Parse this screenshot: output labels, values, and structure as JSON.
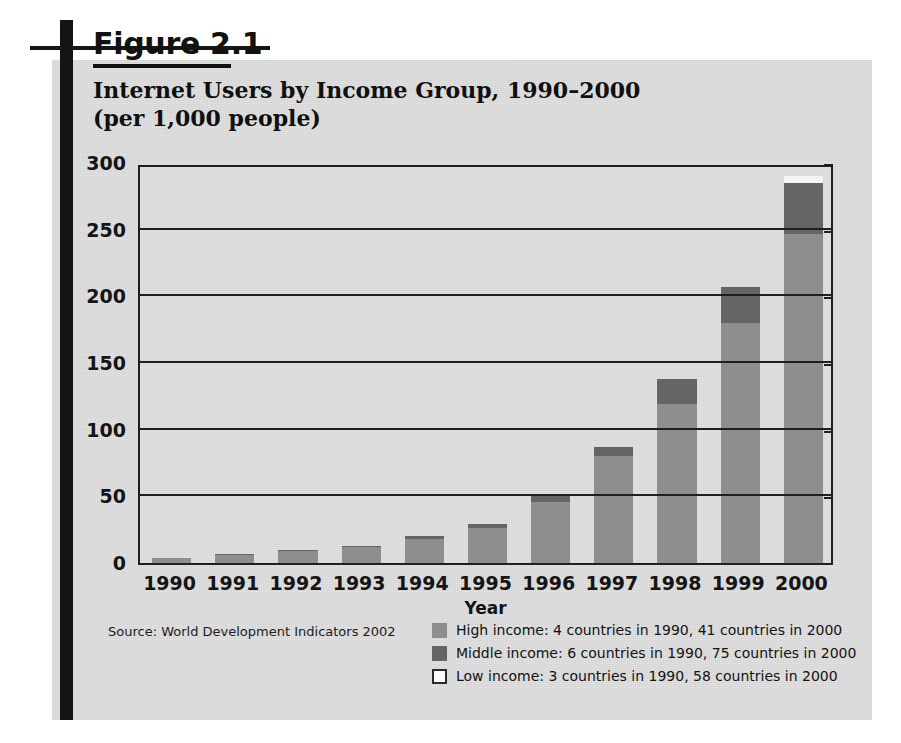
{
  "figure": {
    "number_label": "Figure 2.1",
    "title_line1": "Internet Users by Income Group, 1990–2000",
    "title_line2": "(per 1,000 people)",
    "source": "Source: World Development Indicators 2002"
  },
  "colors": {
    "high_income": "#8e8e8e",
    "middle_income": "#656565",
    "low_income": "#f4f4f4",
    "panel_background": "#d9d9d9",
    "axis": "#1f1f1f",
    "rule": "#141414"
  },
  "legend": {
    "position": "bottom-right",
    "items": [
      {
        "key": "high",
        "swatch": "high",
        "label": "High income: 4 countries in 1990, 41 countries in 2000"
      },
      {
        "key": "middle",
        "swatch": "middle",
        "label": "Middle income: 6 countries in 1990, 75 countries in 2000"
      },
      {
        "key": "low",
        "swatch": "low",
        "label": "Low income: 3 countries in 1990, 58 countries in 2000"
      }
    ]
  },
  "chart_data": {
    "type": "bar",
    "stacked": true,
    "title": "Internet Users by Income Group, 1990–2000 (per 1,000 people)",
    "xlabel": "Year",
    "ylabel": "",
    "ylim": [
      0,
      300
    ],
    "yticks": [
      0,
      50,
      100,
      150,
      200,
      250,
      300
    ],
    "ytick_labels": [
      "0",
      "50",
      "100",
      "150",
      "200",
      "250",
      "300"
    ],
    "grid": true,
    "legend_position": "bottom-right",
    "categories": [
      "1990",
      "1991",
      "1992",
      "1993",
      "1994",
      "1995",
      "1996",
      "1997",
      "1998",
      "1999",
      "2000"
    ],
    "series": [
      {
        "name": "High income",
        "values": [
          4,
          6,
          9,
          12,
          18,
          26,
          46,
          80,
          119,
          180,
          247
        ]
      },
      {
        "name": "Middle income",
        "values": [
          0,
          1,
          1,
          1,
          2,
          3,
          4,
          7,
          19,
          27,
          38
        ]
      },
      {
        "name": "Low income",
        "values": [
          0,
          0,
          0,
          0,
          0,
          0,
          0,
          0,
          0,
          0,
          5
        ]
      }
    ],
    "totals": [
      4,
      7,
      10,
      13,
      20,
      29,
      50,
      87,
      138,
      207,
      290
    ]
  }
}
